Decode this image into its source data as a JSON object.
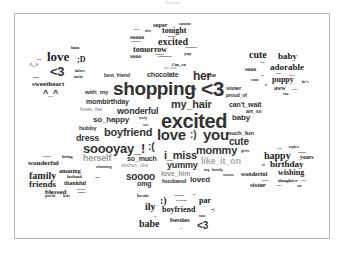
{
  "title": "Parents",
  "clusters": {
    "top": [
      "super",
      "soooooo",
      "tonight",
      "excited",
      "soooo",
      "sooooooo",
      "tomorrow",
      "sooo",
      "yay",
      "ridiculously",
      "ill",
      "i'm_so",
      "her_sister",
      "after",
      "thayre",
      "omgomg",
      "exhausted",
      "ofpharmalin"
    ],
    "top_left": [
      "hun",
      "love",
      ";D",
      "^.^",
      "<3",
      "inlove",
      "mucho",
      "girlie",
      "sweetheart",
      "^_^",
      "muaha"
    ],
    "top_right": [
      "cute",
      "baby",
      "sooo",
      "adorable",
      "soooo",
      "puppy",
      "he's",
      "aww",
      "soo",
      "sweet",
      "her",
      "cutest",
      "babies",
      "awww",
      "is"
    ],
    "center": [
      "best_friend",
      "chocolate",
      "her",
      "she",
      "with_my",
      "shopping",
      "ugh",
      "<3",
      "sister",
      "proud_of",
      "mombirthday",
      "my_hair",
      "can't_wait",
      "loves_her",
      "wonderful",
      "am_so",
      "so_happy",
      "lovely",
      "excited",
      "baby",
      "hubby",
      "soo",
      "boyfriend",
      "love",
      ":)",
      "you",
      "much_fun",
      "dress",
      "soooyay_!",
      ":(",
      "cute",
      "mommy",
      "girls",
      "herself",
      "so_much",
      "i_miss",
      "like_it_on",
      "wishes_she",
      "yummy",
      "cleaning",
      "love_him",
      "my_family",
      "soooo",
      "omg",
      "husband",
      "loved",
      "sooooo"
    ],
    "bottom_left": [
      "cupcakes",
      "loving",
      "wonderful",
      "amazing",
      "family",
      "husband",
      "super",
      "friends",
      "thankful",
      "blessed",
      "boyfriend",
      "daughter",
      "grateful",
      "lucky"
    ],
    "bottom_right": [
      "twins",
      "nephew",
      "grandson",
      "happy",
      "years",
      "st",
      "birthday",
      "wonderful",
      "wishing",
      "brother",
      "daughter",
      "sweet",
      "sister",
      "niece",
      "son"
    ],
    "bottom": [
      "bestie",
      ":)",
      "husband",
      "boyfriend",
      "or",
      "par",
      "ily",
      "boyfriend",
      "=)",
      "babe",
      "besties",
      "xoxo",
      "xx",
      "xo",
      "<3"
    ]
  },
  "words": [
    {
      "t": "super",
      "x": 153,
      "y": 22,
      "s": 6,
      "c": "serif"
    },
    {
      "t": "soooooo",
      "x": 179,
      "y": 23,
      "s": 3.5,
      "c": "serif"
    },
    {
      "t": "thayre",
      "x": 134,
      "y": 28,
      "s": 2,
      "c": "serif"
    },
    {
      "t": "after",
      "x": 145,
      "y": 30,
      "s": 3,
      "c": "serif"
    },
    {
      "t": "tonight",
      "x": 162,
      "y": 27,
      "s": 8,
      "c": "serif"
    },
    {
      "t": "soooo",
      "x": 130,
      "y": 34,
      "s": 6,
      "c": "serif"
    },
    {
      "t": "omgomg",
      "x": 168,
      "y": 35,
      "s": 2,
      "c": "serif"
    },
    {
      "t": "sooooooo",
      "x": 131,
      "y": 41,
      "s": 2.5,
      "c": "serif"
    },
    {
      "t": "excited",
      "x": 158,
      "y": 37,
      "s": 10,
      "c": "serif"
    },
    {
      "t": "tomorrow",
      "x": 133,
      "y": 46,
      "s": 8,
      "c": "serif"
    },
    {
      "t": "ridiculously",
      "x": 185,
      "y": 47,
      "s": 2.5,
      "c": "serif"
    },
    {
      "t": "sooo",
      "x": 130,
      "y": 53,
      "s": 6,
      "c": "serif"
    },
    {
      "t": "exhausted",
      "x": 155,
      "y": 53,
      "s": 2,
      "c": "serif"
    },
    {
      "t": "yay",
      "x": 184,
      "y": 51,
      "s": 5,
      "c": "serif"
    },
    {
      "t": "ofpharmalin",
      "x": 158,
      "y": 56,
      "s": 2.5,
      "c": "serif"
    },
    {
      "t": "i'm_so",
      "x": 172,
      "y": 62,
      "s": 5,
      "c": "serif"
    },
    {
      "t": "her_sister",
      "x": 164,
      "y": 67,
      "s": 3,
      "c": "serif gray"
    },
    {
      "t": "hun",
      "x": 71,
      "y": 45,
      "s": 5,
      "c": "serif"
    },
    {
      "t": "love",
      "x": 47,
      "y": 50,
      "s": 13,
      "c": "serif"
    },
    {
      "t": ";D",
      "x": 77,
      "y": 56,
      "s": 8,
      "c": "serif"
    },
    {
      "t": "girlie",
      "x": 37,
      "y": 58,
      "s": 2,
      "c": "serif"
    },
    {
      "t": "^.^",
      "x": 29,
      "y": 62,
      "s": 7,
      "c": "serif"
    },
    {
      "t": "<3",
      "x": 50,
      "y": 65,
      "s": 13,
      "c": "sans"
    },
    {
      "t": "inlove",
      "x": 75,
      "y": 69,
      "s": 4,
      "c": "serif"
    },
    {
      "t": "muaha",
      "x": 33,
      "y": 76,
      "s": 2,
      "c": "serif"
    },
    {
      "t": "mucho",
      "x": 74,
      "y": 76,
      "s": 3,
      "c": "serif"
    },
    {
      "t": "sweetheart",
      "x": 32,
      "y": 81,
      "s": 7,
      "c": "serif"
    },
    {
      "t": "^_^",
      "x": 43,
      "y": 89,
      "s": 9,
      "c": "sans"
    },
    {
      "t": "cute",
      "x": 249,
      "y": 50,
      "s": 10,
      "c": "serif"
    },
    {
      "t": "baby",
      "x": 278,
      "y": 52,
      "s": 9,
      "c": "serif"
    },
    {
      "t": "sweet",
      "x": 260,
      "y": 61,
      "s": 2,
      "c": "serif"
    },
    {
      "t": "sooo",
      "x": 245,
      "y": 66,
      "s": 6,
      "c": "serif"
    },
    {
      "t": "adorable",
      "x": 270,
      "y": 63,
      "s": 9,
      "c": "serif"
    },
    {
      "t": "her",
      "x": 261,
      "y": 74,
      "s": 2,
      "c": "serif"
    },
    {
      "t": "cutest",
      "x": 276,
      "y": 72,
      "s": 2,
      "c": "serif"
    },
    {
      "t": "babies",
      "x": 289,
      "y": 74,
      "s": 2,
      "c": "serif"
    },
    {
      "t": "soooo",
      "x": 251,
      "y": 79,
      "s": 3,
      "c": "serif"
    },
    {
      "t": "puppy",
      "x": 272,
      "y": 76,
      "s": 8,
      "c": "serif"
    },
    {
      "t": "he's",
      "x": 302,
      "y": 80,
      "s": 4,
      "c": "serif"
    },
    {
      "t": "is",
      "x": 265,
      "y": 84,
      "s": 3,
      "c": "serif"
    },
    {
      "t": "aww",
      "x": 274,
      "y": 85,
      "s": 6,
      "c": "serif"
    },
    {
      "t": "awww",
      "x": 292,
      "y": 88,
      "s": 2,
      "c": "serif"
    },
    {
      "t": "soo",
      "x": 283,
      "y": 92,
      "s": 4,
      "c": "serif"
    },
    {
      "t": "best_friend",
      "x": 104,
      "y": 73,
      "s": 5,
      "c": "sans"
    },
    {
      "t": "chocolate",
      "x": 147,
      "y": 71,
      "s": 7,
      "c": "sans"
    },
    {
      "t": "her",
      "x": 193,
      "y": 70,
      "s": 12,
      "c": "sans"
    },
    {
      "t": "she",
      "x": 206,
      "y": 72,
      "s": 6,
      "c": "sans"
    },
    {
      "t": "with_my",
      "x": 85,
      "y": 89,
      "s": 6,
      "c": "sans"
    },
    {
      "t": "shopping",
      "x": 113,
      "y": 79,
      "s": 19,
      "c": "sans"
    },
    {
      "t": "ugh",
      "x": 191,
      "y": 88,
      "s": 3,
      "c": "sans"
    },
    {
      "t": "<3",
      "x": 201,
      "y": 78,
      "s": 21,
      "c": "sans"
    },
    {
      "t": "sister",
      "x": 226,
      "y": 85,
      "s": 6,
      "c": "sans"
    },
    {
      "t": "proud_of",
      "x": 226,
      "y": 93,
      "s": 5,
      "c": "sans"
    },
    {
      "t": "mombirthday",
      "x": 86,
      "y": 98,
      "s": 7,
      "c": "sans"
    },
    {
      "t": "my_hair",
      "x": 171,
      "y": 99,
      "s": 11,
      "c": "sans"
    },
    {
      "t": "can't_wait",
      "x": 229,
      "y": 101,
      "s": 7,
      "c": "sans"
    },
    {
      "t": "loves_her",
      "x": 80,
      "y": 107,
      "s": 5,
      "c": "sans gray"
    },
    {
      "t": "wonderful",
      "x": 117,
      "y": 107,
      "s": 9,
      "c": "sans"
    },
    {
      "t": "am_so",
      "x": 246,
      "y": 109,
      "s": 5,
      "c": "sans"
    },
    {
      "t": "so_happy",
      "x": 93,
      "y": 116,
      "s": 8,
      "c": "sans"
    },
    {
      "t": "lovely",
      "x": 139,
      "y": 117,
      "s": 3,
      "c": "sans"
    },
    {
      "t": "excited",
      "x": 161,
      "y": 111,
      "s": 20,
      "c": "sans"
    },
    {
      "t": "baby",
      "x": 232,
      "y": 114,
      "s": 8,
      "c": "sans"
    },
    {
      "t": "hubby",
      "x": 79,
      "y": 125,
      "s": 6,
      "c": "sans"
    },
    {
      "t": "soo",
      "x": 143,
      "y": 124,
      "s": 3,
      "c": "sans"
    },
    {
      "t": "boyfriend",
      "x": 104,
      "y": 127,
      "s": 11,
      "c": "sans"
    },
    {
      "t": "love",
      ":": 1,
      "x": 157,
      "y": 127,
      "s": 15,
      "c": "sans"
    },
    {
      "t": ":)",
      "x": 190,
      "y": 130,
      "s": 10,
      "c": "sans"
    },
    {
      "t": "you",
      "x": 203,
      "y": 127,
      "s": 15,
      "c": "sans"
    },
    {
      "t": "much_fun",
      "x": 226,
      "y": 130,
      "s": 6,
      "c": "sans"
    },
    {
      "t": "dress",
      "x": 76,
      "y": 134,
      "s": 9,
      "c": "sans"
    },
    {
      "t": "cute",
      "x": 229,
      "y": 137,
      "s": 10,
      "c": "sans"
    },
    {
      "t": "soooyay_!",
      ":(": 1,
      "x": 83,
      "y": 142,
      "s": 13,
      "c": "sans"
    },
    {
      "t": ":(",
      "x": 148,
      "y": 142,
      "s": 10,
      "c": "sans"
    },
    {
      "t": "mommy",
      "x": 196,
      "y": 145,
      "s": 11,
      "c": "sans"
    },
    {
      "t": "girls",
      "x": 241,
      "y": 149,
      "s": 4,
      "c": "sans"
    },
    {
      "t": "herself",
      "x": 83,
      "y": 154,
      "s": 9,
      "c": "sans gray"
    },
    {
      "t": "so_much",
      "x": 127,
      "y": 155,
      "s": 7,
      "c": "sans"
    },
    {
      "t": "i_miss",
      "x": 164,
      "y": 150,
      "s": 11,
      "c": "sans"
    },
    {
      "t": "like_it_on",
      "x": 201,
      "y": 157,
      "s": 9,
      "c": "sans lgray"
    },
    {
      "t": "cleaning",
      "x": 96,
      "y": 165,
      "s": 4,
      "c": "sans"
    },
    {
      "t": "wishes_she",
      "x": 121,
      "y": 163,
      "s": 5,
      "c": "sans lgray"
    },
    {
      "t": "yummy",
      "x": 167,
      "y": 161,
      "s": 9,
      "c": "sans"
    },
    {
      "t": "love_him",
      "x": 161,
      "y": 170,
      "s": 7,
      "c": "sans gray"
    },
    {
      "t": "my_family",
      "x": 204,
      "y": 168,
      "s": 4,
      "c": "sans"
    },
    {
      "t": "soooo",
      "x": 126,
      "y": 172,
      "s": 10,
      "c": "sans"
    },
    {
      "t": "sooooo",
      "x": 223,
      "y": 174,
      "s": 3,
      "c": "sans"
    },
    {
      "t": "omg",
      "x": 137,
      "y": 180,
      "s": 7,
      "c": "sans"
    },
    {
      "t": "husband",
      "x": 162,
      "y": 178,
      "s": 6,
      "c": "sans"
    },
    {
      "t": "loved",
      "x": 190,
      "y": 176,
      "s": 8,
      "c": "sans"
    },
    {
      "t": "cupcakes",
      "x": 43,
      "y": 155,
      "s": 2,
      "c": "serif"
    },
    {
      "t": "loving",
      "x": 62,
      "y": 155,
      "s": 4,
      "c": "serif"
    },
    {
      "t": "wonderful",
      "x": 28,
      "y": 160,
      "s": 7,
      "c": "serif"
    },
    {
      "t": "amazing",
      "x": 59,
      "y": 168,
      "s": 6,
      "c": "serif"
    },
    {
      "t": "family",
      "x": 29,
      "y": 171,
      "s": 10,
      "c": "serif"
    },
    {
      "t": "husband",
      "x": 67,
      "y": 175,
      "s": 4,
      "c": "serif"
    },
    {
      "t": "super",
      "x": 95,
      "y": 176,
      "s": 2,
      "c": "serif"
    },
    {
      "t": "friends",
      "x": 29,
      "y": 180,
      "s": 9,
      "c": "serif"
    },
    {
      "t": "thankful",
      "x": 64,
      "y": 180,
      "s": 6,
      "c": "serif"
    },
    {
      "t": "blessed",
      "x": 45,
      "y": 189,
      "s": 7,
      "c": "serif"
    },
    {
      "t": "boyfriend",
      "x": 77,
      "y": 188,
      "s": 2,
      "c": "serif"
    },
    {
      "t": "daughter",
      "x": 78,
      "y": 191,
      "s": 2,
      "c": "serif"
    },
    {
      "t": "grateful",
      "x": 45,
      "y": 195,
      "s": 3,
      "c": "serif"
    },
    {
      "t": "lucky",
      "x": 63,
      "y": 195,
      "s": 3,
      "c": "serif"
    },
    {
      "t": "twins",
      "x": 277,
      "y": 147,
      "s": 2,
      "c": "serif"
    },
    {
      "t": "nephew",
      "x": 289,
      "y": 146,
      "s": 3,
      "c": "serif"
    },
    {
      "t": "grandson",
      "x": 298,
      "y": 151,
      "s": 2,
      "c": "serif"
    },
    {
      "t": "happy",
      "x": 264,
      "y": 151,
      "s": 10,
      "c": "serif"
    },
    {
      "t": "years",
      "x": 300,
      "y": 154,
      "s": 6,
      "c": "serif"
    },
    {
      "t": "st",
      "x": 262,
      "y": 163,
      "s": 4,
      "c": "serif"
    },
    {
      "t": "birthday",
      "x": 270,
      "y": 160,
      "s": 9,
      "c": "serif"
    },
    {
      "t": "wonderful",
      "x": 241,
      "y": 171,
      "s": 6,
      "c": "serif"
    },
    {
      "t": "wishing",
      "x": 278,
      "y": 169,
      "s": 8,
      "c": "serif"
    },
    {
      "t": "brother",
      "x": 262,
      "y": 179,
      "s": 2,
      "c": "serif"
    },
    {
      "t": "daughter",
      "x": 278,
      "y": 178,
      "s": 5,
      "c": "serif"
    },
    {
      "t": "sweet",
      "x": 301,
      "y": 179,
      "s": 2,
      "c": "serif"
    },
    {
      "t": "sister",
      "x": 250,
      "y": 182,
      "s": 7,
      "c": "serif"
    },
    {
      "t": "niece",
      "x": 277,
      "y": 184,
      "s": 2,
      "c": "serif"
    },
    {
      "t": "son",
      "x": 297,
      "y": 185,
      "s": 3,
      "c": "serif"
    },
    {
      "t": "bestie",
      "x": 137,
      "y": 193,
      "s": 5,
      "c": "serif"
    },
    {
      "t": ":)",
      "x": 160,
      "y": 196,
      "s": 10,
      "c": "serif"
    },
    {
      "t": "husband",
      "x": 175,
      "y": 195,
      "s": 2.5,
      "c": "serif"
    },
    {
      "t": "or",
      "x": 193,
      "y": 194,
      "s": 2.5,
      "c": "serif"
    },
    {
      "t": "boyfriend",
      "x": 176,
      "y": 200,
      "s": 2.5,
      "c": "serif"
    },
    {
      "t": "par",
      "x": 199,
      "y": 197,
      "s": 8,
      "c": "serif"
    },
    {
      "t": "ily",
      "x": 145,
      "y": 202,
      "s": 10,
      "c": "serif"
    },
    {
      "t": "boyfriend",
      "x": 162,
      "y": 206,
      "s": 8,
      "c": "serif"
    },
    {
      "t": "=)",
      "x": 211,
      "y": 208,
      "s": 4,
      "c": "serif"
    },
    {
      "t": "xx",
      "x": 154,
      "y": 215,
      "s": 2,
      "c": "serif"
    },
    {
      "t": "xoxo",
      "x": 199,
      "y": 215,
      "s": 3,
      "c": "serif"
    },
    {
      "t": "babe",
      "x": 139,
      "y": 219,
      "s": 10,
      "c": "serif"
    },
    {
      "t": "besties",
      "x": 170,
      "y": 217,
      "s": 7,
      "c": "serif"
    },
    {
      "t": "<3",
      "x": 197,
      "y": 221,
      "s": 10,
      "c": "sans"
    },
    {
      "t": "xo",
      "x": 180,
      "y": 227,
      "s": 2,
      "c": "serif"
    }
  ]
}
